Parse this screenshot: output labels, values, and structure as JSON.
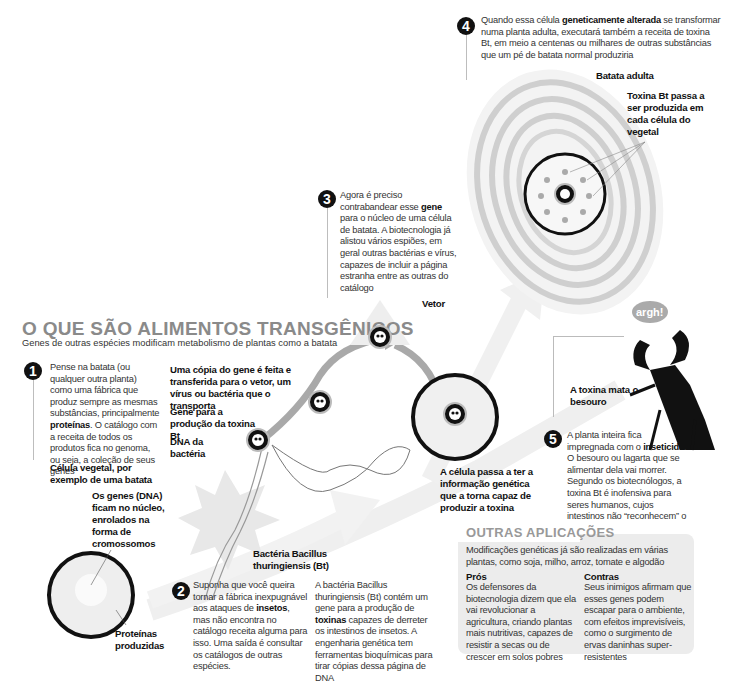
{
  "header": {
    "title": "O QUE SÃO ALIMENTOS TRANSGÊNICOS",
    "subtitle": "Genes de outras espécies modificam metabolismo de plantas como a batata"
  },
  "steps": [
    {
      "number": "1",
      "text_before": "Pense na batata (ou qualquer outra planta) como uma fábrica que produz sempre as mesmas substâncias, principalmente ",
      "bold": "proteínas",
      "text_after": ". O catálogo com a receita de todos os produtos fica no genoma, ou seja, a coleção de seus genes"
    },
    {
      "number": "2",
      "text_before": "Suponha que você queira tornar a fábrica inexpugnável aos ataques de ",
      "bold": "insetos",
      "text_after": ", mas não encontra no catálogo receita alguma para isso. Uma saída é consultar os catálogos de outras espécies.",
      "col2_before": "A bactéria Bacillus thuringiensis (Bt) contém um gene para a produção de ",
      "col2_bold": "toxinas",
      "col2_after": " capazes de derreter os intestinos de insetos. A engenharia genética tem ferramentas bioquímicas para tirar cópias dessa página de DNA"
    },
    {
      "number": "3",
      "text_before": "Agora é preciso contrabandear esse ",
      "bold": "gene",
      "text_after": " para o núcleo de uma célula de batata. A biotecnologia já alistou vários espiões, em geral outras bactérias e vírus, capazes de incluir a página estranha entre as outras do catálogo"
    },
    {
      "number": "4",
      "text_before": "Quando essa célula ",
      "bold": "geneticamente alterada",
      "text_after": " se transformar numa planta adulta, executará também a receita de toxina Bt, em meio a centenas ou milhares de outras substâncias que um pé de batata normal produziria"
    },
    {
      "number": "5",
      "text_before": "A planta inteira fica impregnada com o ",
      "bold": "inseticida",
      "text_after": ". O besouro ou lagarta que se alimentar dela vai morrer. Segundo os biotecnólogos, a toxina Bt é inofensiva para seres humanos, cujos intestinos não “reconhecem” o Bt"
    }
  ],
  "labels": {
    "plant_cell": "Célula vegetal, por exemplo de uma batata",
    "genes_dna": "Os genes (DNA) ficam no núcleo, enrolados na forma de cromossomos",
    "proteins": "Proteínas produzidas",
    "gene_copy": "Uma cópia do gene é feita e transferida para o vetor, um vírus ou bactéria que o transporta",
    "gene_toxin": "Gene para a produção da toxina Bt",
    "bacteria_dna": "DNA da bactéria",
    "bacteria": "Bactéria Bacillus thuringiensis (Bt)",
    "vector": "Vetor",
    "cell_info": "A célula passa a ter a informação genética que a torna capaz de produzir a toxina",
    "adult_potato": "Batata adulta",
    "toxin_produced": "Toxina Bt passa a ser produzida em cada célula do vegetal",
    "toxin_kills": "A toxina mata o besouro",
    "beetle_speech": "argh!"
  },
  "other_applications": {
    "title": "OUTRAS APLICAÇÕES",
    "intro": "Modificações genéticas já são realizadas em várias plantas, como soja, milho, arroz, tomate e algodão",
    "pros": {
      "heading": "Prós",
      "text": "Os defensores da biotecnologia dizem que ela vai revolucionar a agricultura, criando plantas mais nutritivas, capazes de resistir a secas ou de crescer em solos pobres"
    },
    "cons": {
      "heading": "Contras",
      "text": "Seus inimigos afirmam que esses genes podem escapar para o ambiente, com efeitos imprevisíveis, como o surgimento de ervas daninhas super-resistentes"
    }
  },
  "colors": {
    "title_gray": "#8a8a8a",
    "ink": "#111111",
    "light_gray": "#e6e6e6",
    "ring_gray": "#c8c8c8",
    "panel_bg": "#ececec"
  }
}
